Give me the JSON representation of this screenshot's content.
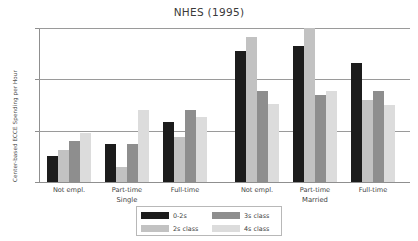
{
  "chart_data": {
    "type": "bar",
    "title": "NHES (1995)",
    "xlabel": "",
    "ylabel": "Center-based ECCE Spending per Hour",
    "ylim": [
      0,
      6
    ],
    "yticks": [
      0,
      2,
      4,
      6
    ],
    "ytick_labels": [
      "0",
      "2",
      "4",
      "6"
    ],
    "grid": true,
    "legend_position": "bottom",
    "categories": [
      "Not empl.",
      "Part-time",
      "Full-time",
      "Not empl.",
      "Part-time",
      "Full-time"
    ],
    "super_categories": [
      {
        "label": "Single",
        "groups": [
          "Not empl.",
          "Part-time",
          "Full-time"
        ]
      },
      {
        "label": "Married",
        "groups": [
          "Not empl.",
          "Part-time",
          "Full-time"
        ]
      }
    ],
    "series": [
      {
        "name": "0-2s",
        "color": "#1c1c1c",
        "values": [
          1.0,
          1.5,
          2.35,
          5.1,
          5.3,
          4.65
        ]
      },
      {
        "name": "2s class",
        "color": "#c2c2c2",
        "values": [
          1.25,
          0.6,
          1.75,
          5.65,
          6.0,
          3.2
        ]
      },
      {
        "name": "3s class",
        "color": "#8e8e8e",
        "values": [
          1.6,
          1.5,
          2.8,
          3.55,
          3.4,
          3.55
        ]
      },
      {
        "name": "4s class",
        "color": "#dcdcdc",
        "values": [
          1.9,
          2.8,
          2.55,
          3.05,
          3.55,
          3.0
        ]
      }
    ],
    "legend_entries": [
      {
        "name": "0-2s",
        "color": "#1c1c1c"
      },
      {
        "name": "2s class",
        "color": "#c2c2c2"
      },
      {
        "name": "3s class",
        "color": "#8e8e8e"
      },
      {
        "name": "4s class",
        "color": "#dcdcdc"
      }
    ]
  }
}
